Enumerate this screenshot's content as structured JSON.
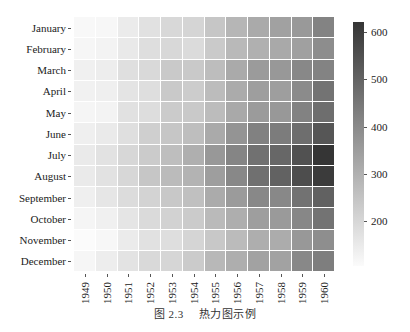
{
  "caption": {
    "figure_number": "图 2.3",
    "title": "热力图示例"
  },
  "colors": {
    "low": "#fbfbfb",
    "high": "#353535",
    "cell_border": "#ffffff"
  },
  "chart_data": {
    "type": "heatmap",
    "title": "",
    "xlabel": "",
    "ylabel": "",
    "x": [
      "1949",
      "1950",
      "1951",
      "1952",
      "1953",
      "1954",
      "1955",
      "1956",
      "1957",
      "1958",
      "1959",
      "1960"
    ],
    "y": [
      "January",
      "February",
      "March",
      "April",
      "May",
      "June",
      "July",
      "August",
      "September",
      "October",
      "November",
      "December"
    ],
    "values": [
      [
        112,
        115,
        145,
        171,
        196,
        204,
        242,
        284,
        315,
        340,
        360,
        417
      ],
      [
        118,
        126,
        150,
        180,
        196,
        188,
        233,
        277,
        301,
        318,
        342,
        391
      ],
      [
        132,
        141,
        178,
        193,
        236,
        235,
        267,
        317,
        356,
        362,
        406,
        419
      ],
      [
        129,
        135,
        163,
        181,
        235,
        227,
        269,
        313,
        348,
        348,
        396,
        461
      ],
      [
        121,
        125,
        172,
        183,
        229,
        234,
        270,
        318,
        355,
        363,
        420,
        472
      ],
      [
        135,
        149,
        178,
        218,
        243,
        264,
        315,
        374,
        422,
        435,
        472,
        535
      ],
      [
        148,
        170,
        199,
        230,
        264,
        302,
        364,
        413,
        465,
        491,
        548,
        622
      ],
      [
        148,
        170,
        199,
        242,
        272,
        293,
        347,
        405,
        467,
        505,
        559,
        606
      ],
      [
        136,
        158,
        184,
        209,
        237,
        259,
        312,
        355,
        404,
        404,
        463,
        508
      ],
      [
        119,
        133,
        162,
        191,
        211,
        229,
        274,
        306,
        347,
        359,
        407,
        461
      ],
      [
        104,
        114,
        146,
        172,
        180,
        203,
        237,
        271,
        305,
        310,
        362,
        390
      ],
      [
        118,
        140,
        166,
        194,
        201,
        229,
        278,
        306,
        336,
        337,
        405,
        432
      ]
    ],
    "vmin": 104,
    "vmax": 622,
    "colormap": "greys (light to dark)",
    "colorbar": {
      "ticks": [
        200,
        300,
        400,
        500,
        600
      ],
      "tick_labels": [
        "200",
        "300",
        "400",
        "500",
        "600"
      ],
      "position": "right"
    },
    "grid": false,
    "legend": "colorbar right"
  }
}
